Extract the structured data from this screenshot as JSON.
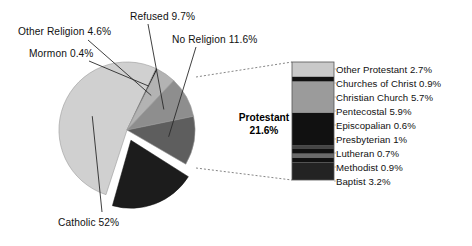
{
  "chart_data": {
    "type": "pie",
    "title": "",
    "subtitle": "",
    "xlabel": "",
    "ylabel": "",
    "grid": false,
    "legend_position": "callout-labels",
    "pie": {
      "categories": [
        "Catholic",
        "Mormon",
        "Other Religion",
        "Refused",
        "No Religion",
        "Protestant"
      ],
      "values": [
        52,
        0.4,
        4.6,
        9.7,
        11.6,
        21.6
      ],
      "labels": [
        "Catholic 52%",
        "Mormon 0.4%",
        "Other Religion 4.6%",
        "Refused 9.7%",
        "No Religion 11.6%",
        "Protestant 21.6%"
      ],
      "colors": [
        "#d0d0d0",
        "#111111",
        "#b3b3b3",
        "#8e8e8e",
        "#5e5e5e",
        "#1c1c1c"
      ],
      "exploded_slice": "Protestant"
    },
    "breakdown_bar": {
      "parent": "Protestant",
      "parent_value": 21.6,
      "parent_label": "Protestant",
      "parent_percent": "21.6%",
      "categories": [
        "Other Protestant",
        "Churches of Christ",
        "Christian Church",
        "Pentecostal",
        "Episcopalian",
        "Presbyterian",
        "Lutheran",
        "Methodist",
        "Baptist"
      ],
      "values": [
        2.7,
        0.9,
        5.7,
        5.9,
        0.6,
        1,
        0.7,
        0.9,
        3.2
      ],
      "labels": [
        "Other Protestant 2.7%",
        "Churches of Christ 0.9%",
        "Christian Church 5.7%",
        "Pentecostal 5.9%",
        "Episcopalian 0.6%",
        "Presbyterian 1%",
        "Lutheran 0.7%",
        "Methodist 0.9%",
        "Baptist 3.2%"
      ],
      "colors": [
        "#c9c9c9",
        "#111111",
        "#9b9b9b",
        "#111111",
        "#454545",
        "#111111",
        "#6a6a6a",
        "#111111",
        "#232323"
      ]
    }
  },
  "pie_callouts": [
    {
      "label": "Other Religion 4.6%",
      "left": 18,
      "top": 26
    },
    {
      "label": "Mormon 0.4%",
      "left": 29,
      "top": 48
    },
    {
      "label": "Refused 9.7%",
      "left": 130,
      "top": 11
    },
    {
      "label": "No Religion 11.6%",
      "left": 172,
      "top": 34
    },
    {
      "label": "Catholic 52%",
      "left": 58,
      "top": 217
    }
  ],
  "protestant_callout": {
    "name": "Protestant",
    "percent": "21.6%"
  },
  "bar_labels": [
    {
      "label": "Other Protestant 2.7%",
      "top": 64
    },
    {
      "label": "Churches of Christ 0.9%",
      "top": 78
    },
    {
      "label": "Christian Church 5.7%",
      "top": 92
    },
    {
      "label": "Pentecostal 5.9%",
      "top": 106
    },
    {
      "label": "Episcopalian 0.6%",
      "top": 120
    },
    {
      "label": "Presbyterian 1%",
      "top": 134
    },
    {
      "label": "Lutheran 0.7%",
      "top": 148
    },
    {
      "label": "Methodist 0.9%",
      "top": 162
    },
    {
      "label": "Baptist 3.2%",
      "top": 176
    }
  ]
}
